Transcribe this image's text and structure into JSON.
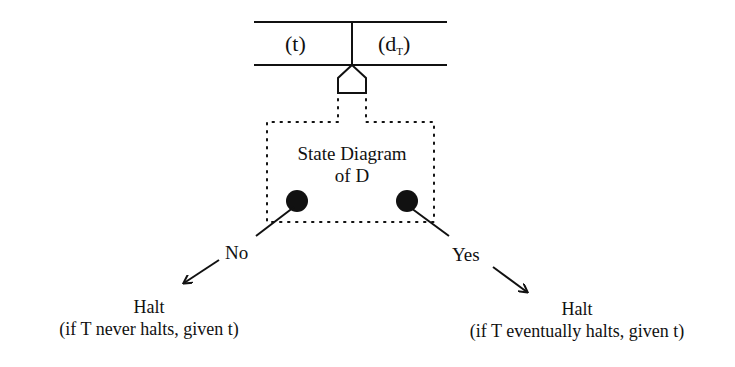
{
  "diagram": {
    "type": "turing-machine-halting-schematic",
    "tape": {
      "cells": [
        {
          "label": "(t)"
        },
        {
          "label_main": "(d",
          "label_sub": "T",
          "label_close": ")"
        }
      ]
    },
    "machine": {
      "label_line1": "State Diagram",
      "label_line2": "of D"
    },
    "branches": [
      {
        "id": "no",
        "label": "No",
        "outcome_title": "Halt",
        "outcome_condition": "(if T never halts, given t)"
      },
      {
        "id": "yes",
        "label": "Yes",
        "outcome_title": "Halt",
        "outcome_condition": "(if T eventually halts, given t)"
      }
    ],
    "colors": {
      "ink": "#111111",
      "background": "#ffffff"
    }
  }
}
